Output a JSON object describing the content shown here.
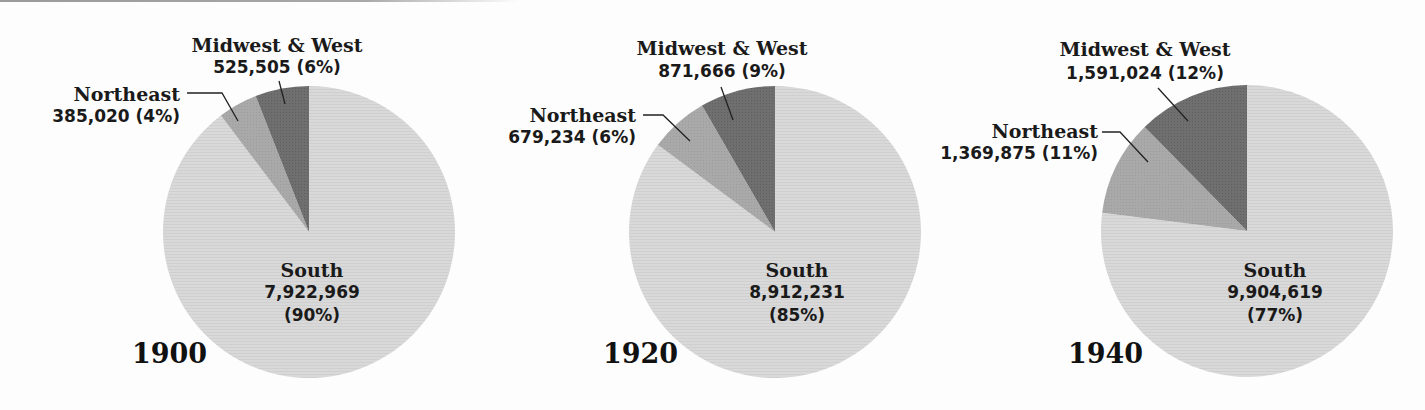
{
  "colors": {
    "south": "#d8d8d8",
    "northeast": "#a8a8a8",
    "midwest_west": "#6e6e6e",
    "text": "#1a1a1a",
    "background": "#fdfdfd"
  },
  "chart_data": [
    {
      "type": "pie",
      "title": "1900",
      "categories": [
        "Midwest & West",
        "Northeast",
        "South"
      ],
      "values": [
        525505,
        385020,
        7922969
      ],
      "percent_labels": [
        "6%",
        "4%",
        "90%"
      ],
      "start_angle": "12 o'clock, Midwest & West and Northeast counterclockwise, South fills remainder"
    },
    {
      "type": "pie",
      "title": "1920",
      "categories": [
        "Midwest & West",
        "Northeast",
        "South"
      ],
      "values": [
        871666,
        679234,
        8912231
      ],
      "percent_labels": [
        "9%",
        "6%",
        "85%"
      ]
    },
    {
      "type": "pie",
      "title": "1940",
      "categories": [
        "Midwest & West",
        "Northeast",
        "South"
      ],
      "values": [
        1591024,
        1369875,
        9904619
      ],
      "percent_labels": [
        "12%",
        "11%",
        "77%"
      ]
    }
  ],
  "panels": [
    {
      "year": "1900",
      "pie": {
        "cx": 309,
        "cy": 232,
        "r": 146
      },
      "year_label": {
        "x": 132,
        "y": 363
      },
      "midwest": {
        "name": "Midwest & West",
        "value_text": "525,505 (6%)",
        "x": 277,
        "y1": 52,
        "y2": 73,
        "leader": [
          [
            279,
            81
          ],
          [
            285,
            104
          ]
        ]
      },
      "northeast": {
        "name": "Northeast",
        "value_text": "385,020 (4%)",
        "x": 180,
        "y1": 101,
        "y2": 122,
        "leader": [
          [
            187,
            93
          ],
          [
            222,
            93
          ],
          [
            238,
            121
          ]
        ]
      },
      "south": {
        "name": "South",
        "value_text": "7,922,969",
        "pct_text": "(90%)",
        "x": 312,
        "y1": 277,
        "y2": 298,
        "y3": 321
      }
    },
    {
      "year": "1920",
      "pie": {
        "cx": 775,
        "cy": 232,
        "r": 146
      },
      "year_label": {
        "x": 603,
        "y": 363
      },
      "midwest": {
        "name": "Midwest & West",
        "value_text": "871,666 (9%)",
        "x": 722,
        "y1": 55,
        "y2": 77,
        "leader": [
          [
            721,
            87
          ],
          [
            733,
            120
          ]
        ]
      },
      "northeast": {
        "name": "Northeast",
        "value_text": "679,234 (6%)",
        "x": 636,
        "y1": 122,
        "y2": 143,
        "leader": [
          [
            643,
            115
          ],
          [
            663,
            115
          ],
          [
            690,
            141
          ]
        ]
      },
      "south": {
        "name": "South",
        "value_text": "8,912,231",
        "pct_text": "(85%)",
        "x": 797,
        "y1": 277,
        "y2": 298,
        "y3": 321
      }
    },
    {
      "year": "1940",
      "pie": {
        "cx": 1247,
        "cy": 231,
        "r": 146
      },
      "year_label": {
        "x": 1068,
        "y": 363
      },
      "midwest": {
        "name": "Midwest & West",
        "value_text": "1,591,024 (12%)",
        "x": 1145,
        "y1": 56,
        "y2": 79,
        "leader": [
          [
            1158,
            88
          ],
          [
            1188,
            121
          ]
        ]
      },
      "northeast": {
        "name": "Northeast",
        "value_text": "1,369,875 (11%)",
        "x": 1098,
        "y1": 138,
        "y2": 159,
        "leader": [
          [
            1102,
            132
          ],
          [
            1120,
            132
          ],
          [
            1148,
            162
          ]
        ]
      },
      "south": {
        "name": "South",
        "value_text": "9,904,619",
        "pct_text": "(77%)",
        "x": 1275,
        "y1": 277,
        "y2": 298,
        "y3": 321
      }
    }
  ]
}
